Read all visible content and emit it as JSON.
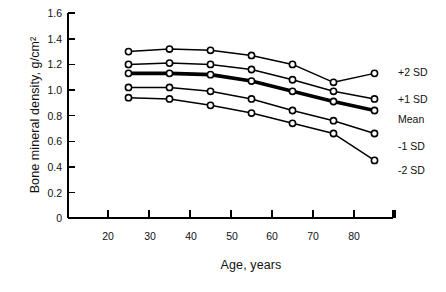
{
  "chart_data": {
    "type": "line",
    "title": "",
    "xlabel": "Age, years",
    "ylabel": "Bone mineral density, g/cm²",
    "xlim": [
      15,
      90
    ],
    "ylim": [
      0,
      1.6
    ],
    "grid": false,
    "legend_position": "right-inline",
    "x_ticks": [
      "20",
      "30",
      "40",
      "50",
      "60",
      "70",
      "80"
    ],
    "x_tick_values": [
      20,
      30,
      40,
      50,
      60,
      70,
      80
    ],
    "y_ticks": [
      "0",
      "0.2",
      "0.4",
      "0.6",
      "0.8",
      "1.0",
      "1.2",
      "1.4",
      "1.6"
    ],
    "y_tick_values": [
      0,
      0.2,
      0.4,
      0.6,
      0.8,
      1.0,
      1.2,
      1.4,
      1.6
    ],
    "x": [
      25,
      35,
      45,
      55,
      65,
      75,
      85
    ],
    "series": [
      {
        "name": "+2 SD",
        "values": [
          1.3,
          1.32,
          1.31,
          1.27,
          1.2,
          1.06,
          1.13
        ],
        "emphasis": false
      },
      {
        "name": "+1 SD",
        "values": [
          1.2,
          1.21,
          1.2,
          1.16,
          1.08,
          0.99,
          0.93
        ],
        "emphasis": false
      },
      {
        "name": "Mean",
        "values": [
          1.13,
          1.13,
          1.12,
          1.07,
          0.99,
          0.91,
          0.84
        ],
        "emphasis": true
      },
      {
        "name": "-1 SD",
        "values": [
          1.02,
          1.02,
          0.99,
          0.93,
          0.84,
          0.76,
          0.66
        ],
        "emphasis": false
      },
      {
        "name": "-2 SD",
        "values": [
          0.94,
          0.93,
          0.88,
          0.82,
          0.74,
          0.66,
          0.45
        ]
      }
    ],
    "series_labels": [
      "+2 SD",
      "+1 SD",
      "Mean",
      "-1 SD",
      "-2 SD"
    ],
    "colors": {
      "line": "#000000",
      "marker_fill": "#ffffff",
      "axis": "#000000",
      "background": "#ffffff"
    }
  }
}
